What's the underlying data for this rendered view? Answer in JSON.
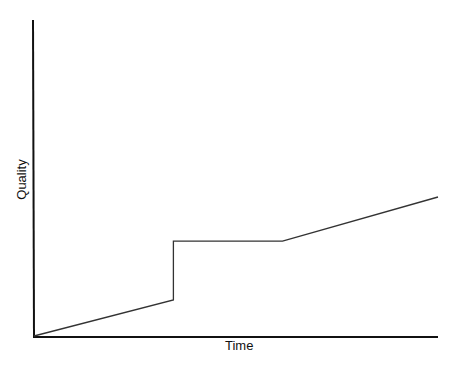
{
  "chart_data": {
    "type": "line",
    "title": "",
    "xlabel": "Time",
    "ylabel": "Quality",
    "grid": false,
    "legend": null,
    "x": [
      0,
      0.345,
      0.345,
      0.615,
      1.0
    ],
    "series": [
      {
        "name": "Quality over time",
        "values": [
          0,
          0.114,
          0.3,
          0.3,
          0.44
        ]
      }
    ],
    "xlim": [
      0,
      1
    ],
    "ylim": [
      0,
      1
    ],
    "annotations": []
  },
  "colors": {
    "axis": "#111111",
    "line": "#333333",
    "background": "#ffffff"
  }
}
